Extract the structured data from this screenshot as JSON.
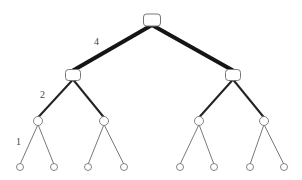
{
  "diagram": {
    "type": "binary-tree",
    "levels": 4,
    "edge_labels": [
      {
        "text": "4",
        "level": 0,
        "x": 94,
        "y": 45
      },
      {
        "text": "2",
        "level": 1,
        "x": 40,
        "y": 98
      },
      {
        "text": "1",
        "level": 2,
        "x": 16,
        "y": 145
      }
    ],
    "nodes": {
      "root": {
        "id": "n0",
        "x": 152,
        "y": 20,
        "w": 17,
        "h": 12,
        "shape": "rounded-rect"
      },
      "level1": [
        {
          "id": "n1",
          "x": 73,
          "y": 75,
          "w": 15,
          "h": 11,
          "shape": "rounded-rect"
        },
        {
          "id": "n2",
          "x": 233,
          "y": 75,
          "w": 15,
          "h": 11,
          "shape": "rounded-rect"
        }
      ],
      "level2": [
        {
          "id": "n3",
          "x": 38,
          "y": 121,
          "r": 4.5,
          "shape": "circle"
        },
        {
          "id": "n4",
          "x": 104,
          "y": 121,
          "r": 4.5,
          "shape": "circle"
        },
        {
          "id": "n5",
          "x": 199,
          "y": 121,
          "r": 4.5,
          "shape": "circle"
        },
        {
          "id": "n6",
          "x": 264,
          "y": 121,
          "r": 4.5,
          "shape": "circle"
        }
      ],
      "leaves": [
        {
          "id": "n7",
          "x": 20,
          "y": 167,
          "r": 3.5,
          "shape": "circle"
        },
        {
          "id": "n8",
          "x": 54,
          "y": 167,
          "r": 3.5,
          "shape": "circle"
        },
        {
          "id": "n9",
          "x": 88,
          "y": 167,
          "r": 3.5,
          "shape": "circle"
        },
        {
          "id": "n10",
          "x": 124,
          "y": 167,
          "r": 3.5,
          "shape": "circle"
        },
        {
          "id": "n11",
          "x": 180,
          "y": 167,
          "r": 3.5,
          "shape": "circle"
        },
        {
          "id": "n12",
          "x": 214,
          "y": 167,
          "r": 3.5,
          "shape": "circle"
        },
        {
          "id": "n13",
          "x": 250,
          "y": 167,
          "r": 3.5,
          "shape": "circle"
        },
        {
          "id": "n14",
          "x": 284,
          "y": 167,
          "r": 3.5,
          "shape": "circle"
        }
      ]
    },
    "edges": [
      {
        "from": "n0",
        "to": "n1",
        "width": 4
      },
      {
        "from": "n0",
        "to": "n2",
        "width": 4
      },
      {
        "from": "n1",
        "to": "n3",
        "width": 2
      },
      {
        "from": "n1",
        "to": "n4",
        "width": 2
      },
      {
        "from": "n2",
        "to": "n5",
        "width": 2
      },
      {
        "from": "n2",
        "to": "n6",
        "width": 2
      },
      {
        "from": "n3",
        "to": "n7",
        "width": 1
      },
      {
        "from": "n3",
        "to": "n8",
        "width": 1
      },
      {
        "from": "n4",
        "to": "n9",
        "width": 1
      },
      {
        "from": "n4",
        "to": "n10",
        "width": 1
      },
      {
        "from": "n5",
        "to": "n11",
        "width": 1
      },
      {
        "from": "n5",
        "to": "n12",
        "width": 1
      },
      {
        "from": "n6",
        "to": "n13",
        "width": 1
      },
      {
        "from": "n6",
        "to": "n14",
        "width": 1
      }
    ],
    "colors": {
      "background": "#ffffff",
      "edge": "#1a1a1a",
      "node_stroke": "#777777",
      "label": "#444444"
    }
  }
}
